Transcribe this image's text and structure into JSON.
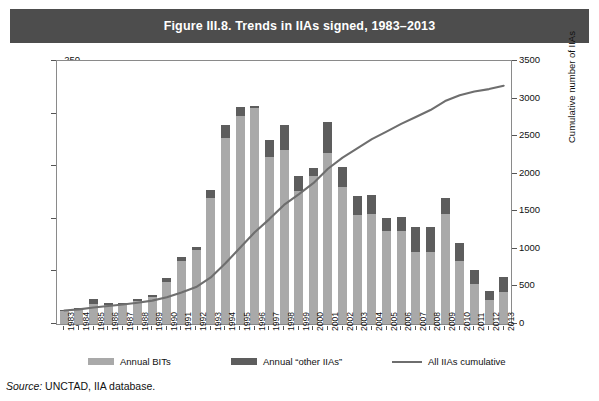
{
  "figure": {
    "title": "Figure III.8. Trends in IIAs signed, 1983–2013",
    "source_label": "Source:",
    "source_text": " UNCTAD, IIA database."
  },
  "legend": {
    "position": "bottom",
    "items": [
      {
        "label": "Annual BITs",
        "marker": "filled-square",
        "color": "#a9a9a9"
      },
      {
        "label": "Annual “other IIAs”",
        "marker": "filled-square",
        "color": "#5d5d5d"
      },
      {
        "label": "All IIAs cumulative",
        "marker": "line",
        "color": "#6e6e6e"
      }
    ]
  },
  "chart_data": {
    "type": "bar",
    "title": "Figure III.8. Trends in IIAs signed, 1983–2013",
    "xlabel": "",
    "ylabel": "Annual number of IIAs",
    "y2label": "Cumulative number of IIAs",
    "ylim": [
      0,
      250
    ],
    "y2lim": [
      0,
      3500
    ],
    "yticks": [
      0,
      50,
      100,
      150,
      200,
      250
    ],
    "y2ticks": [
      0,
      500,
      1000,
      1500,
      2000,
      2500,
      3000,
      3500
    ],
    "grid": false,
    "stacked": true,
    "categories": [
      "1983",
      "1984",
      "1985",
      "1986",
      "1987",
      "1988",
      "1989",
      "1990",
      "1991",
      "1992",
      "1993",
      "1994",
      "1995",
      "1996",
      "1997",
      "1998",
      "1999",
      "2000",
      "2001",
      "2002",
      "2003",
      "2004",
      "2005",
      "2006",
      "2007",
      "2008",
      "2009",
      "2010",
      "2011",
      "2012",
      "2013"
    ],
    "series": [
      {
        "name": "Annual BITs",
        "axis": "left",
        "color": "#a9a9a9",
        "values": [
          12,
          14,
          19,
          18,
          18,
          22,
          26,
          40,
          60,
          70,
          120,
          177,
          198,
          205,
          159,
          165,
          126,
          141,
          163,
          130,
          104,
          105,
          88,
          88,
          68,
          68,
          105,
          60,
          38,
          23,
          30
        ]
      },
      {
        "name": "Annual “other IIAs”",
        "axis": "left",
        "color": "#5d5d5d",
        "values": [
          1,
          1,
          5,
          2,
          2,
          2,
          2,
          4,
          4,
          3,
          7,
          12,
          8,
          2,
          16,
          24,
          15,
          7,
          29,
          19,
          18,
          18,
          13,
          14,
          24,
          24,
          15,
          17,
          13,
          8,
          15
        ]
      },
      {
        "name": "All IIAs cumulative",
        "axis": "right",
        "color": "#6e6e6e",
        "type": "line",
        "values": [
          180,
          195,
          219,
          239,
          259,
          283,
          311,
          355,
          419,
          492,
          619,
          808,
          1014,
          1221,
          1396,
          1585,
          1726,
          1874,
          2066,
          2215,
          2337,
          2460,
          2561,
          2663,
          2755,
          2847,
          2967,
          3044,
          3095,
          3126,
          3171
        ]
      }
    ]
  }
}
